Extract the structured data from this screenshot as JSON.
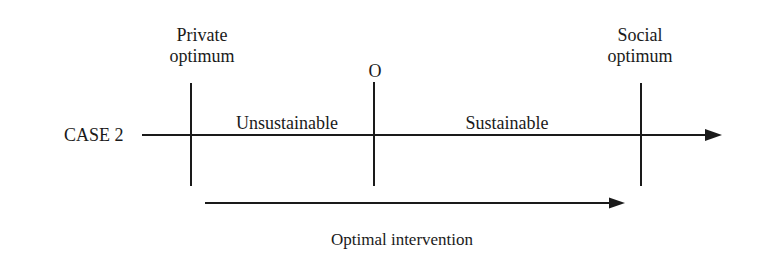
{
  "diagram": {
    "case_label": "CASE 2",
    "markers": [
      {
        "id": "private",
        "line1": "Private",
        "line2": "optimum"
      },
      {
        "id": "o",
        "line1": "O"
      },
      {
        "id": "social",
        "line1": "Social",
        "line2": "optimum"
      }
    ],
    "regions": [
      {
        "label": "Unsustainable"
      },
      {
        "label": "Sustainable"
      }
    ],
    "intervention_label": "Optimal intervention",
    "line_color": "#1a1a1a"
  }
}
